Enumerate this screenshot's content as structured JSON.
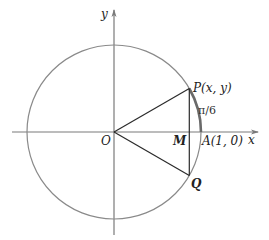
{
  "diagram": {
    "type": "unit-circle",
    "axes": {
      "x_label": "x",
      "y_label": "y"
    },
    "points": {
      "origin": {
        "label": "O"
      },
      "P": {
        "label": "P(x, y)"
      },
      "A": {
        "label": "A(1, 0)"
      },
      "M": {
        "label": "M"
      },
      "Q": {
        "label": "Q"
      }
    },
    "arc_label": "π/6",
    "colors": {
      "circle": "#8a8a8a",
      "axis": "#7a7a7a",
      "segment": "#2a2a2a",
      "arc_highlight": "#6a6a6a"
    }
  }
}
